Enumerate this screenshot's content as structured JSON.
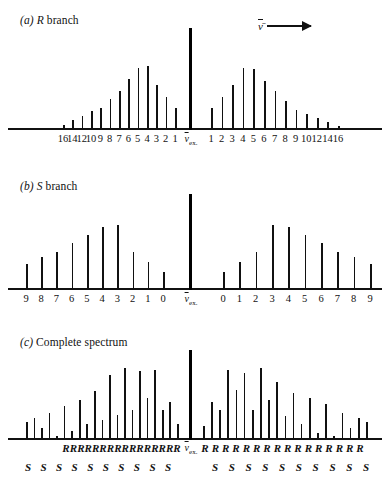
{
  "figure": {
    "center_label": "ν̄",
    "center_sub": "ex.",
    "arrow_symbol": "ν̄"
  },
  "panels": [
    {
      "key": "a",
      "index_label": "(a)",
      "symbol": "R",
      "title": "branch"
    },
    {
      "key": "b",
      "index_label": "(b)",
      "symbol": "S",
      "title": "branch"
    },
    {
      "key": "c",
      "index_label": "(c)",
      "symbol": "",
      "title": "Complete spectrum"
    }
  ],
  "branch_letters": {
    "R": "R",
    "S": "S"
  },
  "chart_data": [
    {
      "type": "bar",
      "panel": "a",
      "title": "(a) R branch",
      "subtitle": "Rotational R branch stick spectrum about the exciting line",
      "xlabel": "",
      "ylabel": "",
      "grid": false,
      "legend": null,
      "center_line": {
        "label": "ν̄ex.",
        "x": 0,
        "height": 1.0
      },
      "axis_direction_annotation": {
        "symbol": "ν̄",
        "arrow": "right"
      },
      "left_branch": {
        "tick_labels": [
          "16",
          "14",
          "12",
          "10",
          "9",
          "8",
          "7",
          "6",
          "5",
          "4",
          "3",
          "2",
          "1"
        ],
        "x": [
          -16,
          -14,
          -12,
          -10,
          -9,
          -8,
          -7,
          -6,
          -5,
          -4,
          -3,
          -2,
          -1
        ],
        "values": [
          0.05,
          0.1,
          0.14,
          0.19,
          0.22,
          0.3,
          0.38,
          0.5,
          0.61,
          0.63,
          0.44,
          0.32,
          0.22
        ]
      },
      "right_branch": {
        "tick_labels": [
          "1",
          "2",
          "3",
          "4",
          "5",
          "6",
          "7",
          "8",
          "9",
          "10",
          "12",
          "14",
          "16"
        ],
        "x": [
          1,
          2,
          3,
          4,
          5,
          6,
          7,
          8,
          9,
          10,
          12,
          14,
          16
        ],
        "values": [
          0.22,
          0.32,
          0.44,
          0.61,
          0.6,
          0.48,
          0.38,
          0.28,
          0.2,
          0.16,
          0.12,
          0.08,
          0.04
        ]
      },
      "ylim": [
        0,
        1.0
      ]
    },
    {
      "type": "bar",
      "panel": "b",
      "title": "(b) S branch",
      "subtitle": "Rotational S branch stick spectrum about the exciting line",
      "xlabel": "",
      "ylabel": "",
      "grid": false,
      "legend": null,
      "center_line": {
        "label": "ν̄ex.",
        "x": 0,
        "height": 1.0
      },
      "left_branch": {
        "tick_labels": [
          "9",
          "8",
          "7",
          "6",
          "5",
          "4",
          "3",
          "2",
          "1",
          "0"
        ],
        "x": [
          -9,
          -8,
          -7,
          -6,
          -5,
          -4,
          -3,
          -2,
          -1,
          0
        ],
        "values": [
          0.27,
          0.34,
          0.4,
          0.49,
          0.57,
          0.66,
          0.68,
          0.4,
          0.29,
          0.19
        ]
      },
      "right_branch": {
        "tick_labels": [
          "0",
          "1",
          "2",
          "3",
          "4",
          "5",
          "6",
          "7",
          "8",
          "9"
        ],
        "x": [
          0,
          1,
          2,
          3,
          4,
          5,
          6,
          7,
          8,
          9
        ],
        "values": [
          0.19,
          0.29,
          0.4,
          0.68,
          0.66,
          0.57,
          0.49,
          0.4,
          0.34,
          0.27
        ]
      },
      "ylim": [
        0,
        1.0
      ]
    },
    {
      "type": "bar",
      "panel": "c",
      "title": "(c) Complete spectrum",
      "subtitle": "Superposition of R and S branches about the exciting line",
      "xlabel": "",
      "ylabel": "",
      "grid": false,
      "legend": null,
      "center_line": {
        "label": "ν̄ex.",
        "x": 0,
        "height": 1.0
      },
      "left_branch": {
        "branch_letters_R_count": 16,
        "branch_letters_S_count": 10,
        "values": [
          0.2,
          0.25,
          0.13,
          0.3,
          0.05,
          0.38,
          0.1,
          0.45,
          0.18,
          0.55,
          0.22,
          0.72,
          0.28,
          0.8,
          0.33,
          0.77,
          0.47,
          0.78,
          0.33,
          0.42,
          0.18
        ],
        "letters": [
          "S",
          "R",
          "S",
          "R",
          "S",
          "R",
          "S",
          "R",
          "S",
          "R",
          "S",
          "R",
          "S",
          "R",
          "S",
          "R",
          "R",
          "R",
          "R",
          "R",
          "R"
        ]
      },
      "right_branch": {
        "branch_letters_R_count": 16,
        "branch_letters_S_count": 10,
        "values": [
          0.16,
          0.42,
          0.33,
          0.78,
          0.56,
          0.74,
          0.33,
          0.8,
          0.45,
          0.65,
          0.27,
          0.52,
          0.18,
          0.47,
          0.08,
          0.4,
          0.05,
          0.3,
          0.13,
          0.25,
          0.2
        ],
        "letters": [
          "R",
          "R",
          "R",
          "R",
          "R",
          "R",
          "R",
          "R",
          "R",
          "R",
          "R",
          "R",
          "R",
          "R",
          "R",
          "R",
          "S",
          "S",
          "S",
          "S",
          "S"
        ]
      },
      "ylim": [
        0,
        1.0
      ]
    }
  ]
}
